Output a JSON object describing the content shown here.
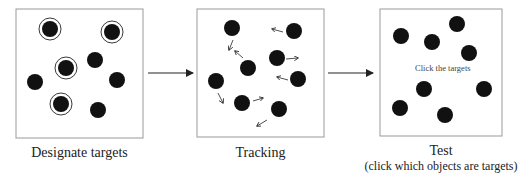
{
  "panels": [
    {
      "caption": "Designate targets"
    },
    {
      "caption": "Tracking"
    },
    {
      "caption": "Test",
      "subcaption": "(click which objects are targets)",
      "inner_text": "Click the targets"
    }
  ]
}
